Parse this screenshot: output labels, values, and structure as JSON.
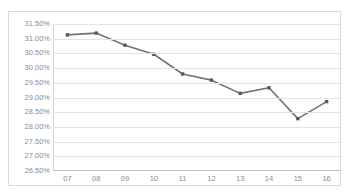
{
  "chart_title": "",
  "colors": {
    "line": "#737373",
    "marker": "#595959",
    "gridline": "#e3e3e3",
    "axis": "#bfbfbf",
    "tick_label": "#8c8c8c",
    "frame": "#d9d9d9",
    "background": "#ffffff"
  },
  "chart_data": {
    "type": "line",
    "title": "",
    "xlabel": "",
    "ylabel": "",
    "categories": [
      "07",
      "08",
      "09",
      "10",
      "11",
      "12",
      "13",
      "14",
      "15",
      "16"
    ],
    "series": [
      {
        "name": "",
        "values": [
          31.13,
          31.19,
          30.78,
          30.47,
          29.8,
          29.59,
          29.14,
          29.33,
          28.28,
          28.86
        ]
      }
    ],
    "ylim": [
      26.5,
      31.5
    ],
    "ytick_step": 0.5,
    "ytick_labels": [
      "31.50%",
      "31.00%",
      "30.50%",
      "30.00%",
      "29.50%",
      "29.00%",
      "28.50%",
      "28.00%",
      "27.50%",
      "27.00%",
      "26.50%"
    ],
    "ytick_values": [
      31.5,
      31.0,
      30.5,
      30.0,
      29.5,
      29.0,
      28.5,
      28.0,
      27.5,
      27.0,
      26.5
    ],
    "grid": true,
    "legend": "none",
    "markers": "square"
  }
}
